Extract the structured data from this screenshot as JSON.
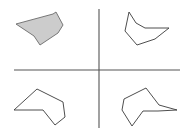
{
  "figure": {
    "width": 186,
    "height": 128,
    "background_color": "#ffffff"
  },
  "axes": {
    "name": "crosshair-axes",
    "color": "#555555",
    "stroke_width": 1.1,
    "center": {
      "x": 99,
      "y": 70
    },
    "horizontal": {
      "x1": 14,
      "y1": 70,
      "x2": 180,
      "y2": 70
    },
    "vertical": {
      "x1": 99,
      "y1": 9,
      "x2": 99,
      "y2": 128
    }
  },
  "style": {
    "filled_fill_color": "#cccccc",
    "filled_stroke_color": "#6b6b6b",
    "outline_stroke_color": "#3a3a3a",
    "outline_fill": "none",
    "stroke_width": 0.9
  },
  "shapes": [
    {
      "id": "shape-top-left",
      "quadrant": "top-left",
      "filled": true,
      "fill_color": "#cccccc",
      "stroke_color": "#6b6b6b",
      "points": "16,24 53,14 56,12 63,25 58,33 40,45 34,36",
      "label": "reference-shape"
    },
    {
      "id": "shape-top-right",
      "quadrant": "top-right",
      "filled": false,
      "fill_color": "none",
      "stroke_color": "#3a3a3a",
      "points": "136,23 129,12 125,31 137,45 155,39 169,28 145,28",
      "label": "candidate-shape-1"
    },
    {
      "id": "shape-bottom-left",
      "quadrant": "bottom-left",
      "filled": false,
      "fill_color": "none",
      "stroke_color": "#3a3a3a",
      "points": "37,89 63,102 65,117 55,125 43,110 14,110",
      "label": "candidate-shape-2"
    },
    {
      "id": "shape-bottom-right",
      "quadrant": "bottom-right",
      "filled": false,
      "fill_color": "none",
      "stroke_color": "#3a3a3a",
      "points": "146,88 159,105 177,110 158,111 143,111 132,126 122,110 124,99"
    }
  ]
}
